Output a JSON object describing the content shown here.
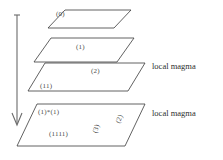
{
  "figure": {
    "background_color": "#ffffff",
    "line_color": "#3a3a3a",
    "arrow_color": "#6b6b6b",
    "text_color": "#4a4a4a"
  },
  "arrow": {
    "name": "downward-arrow",
    "direction": "down",
    "x": 17,
    "y_start": 15,
    "y_end": 124
  },
  "planes": [
    {
      "id": "plane-0",
      "label": "(0)",
      "label_x": 56,
      "label_y": 11,
      "points": "48,28 65,10 131,10 114,28"
    },
    {
      "id": "plane-1",
      "label": "(1)",
      "label_x": 76,
      "label_y": 44,
      "points": "34,62 51,38 134,38 117,62"
    },
    {
      "id": "plane-2",
      "label": "(2)",
      "label_x": 91,
      "label_y": 68,
      "points": "28,91 45,63 145,63 128,91"
    },
    {
      "id": "plane-3",
      "label": "(3)",
      "label_x": 92,
      "label_y": 126,
      "points": "17,146 37,104 145,104 125,146"
    }
  ],
  "plane_annotations": [
    {
      "name": "annotation-ii",
      "text": "(11)",
      "x": 40,
      "y": 83
    },
    {
      "name": "annotation-i-star-i",
      "text": "(1)*(1)",
      "x": 38,
      "y": 109
    },
    {
      "name": "annotation-iiii",
      "text": "(1111)",
      "x": 49,
      "y": 131
    },
    {
      "name": "annotation-ii-rotated",
      "text": "(2)",
      "x": 115,
      "y": 110
    }
  ],
  "magma_labels": [
    {
      "name": "local-magma-label-upper",
      "text": "local magma",
      "x": 152,
      "y": 62
    },
    {
      "name": "local-magma-label-lower",
      "text": "local magma",
      "x": 152,
      "y": 109
    }
  ]
}
